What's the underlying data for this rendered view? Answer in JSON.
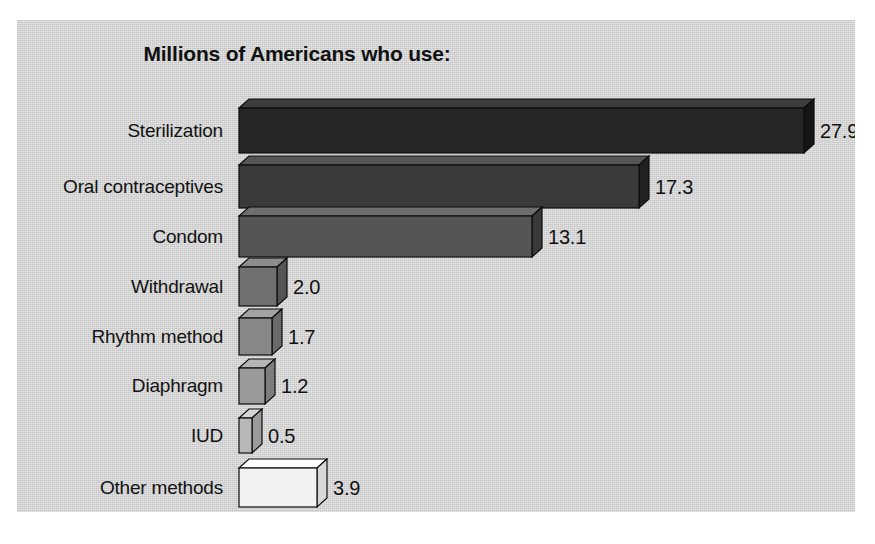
{
  "figure": {
    "panel_bg": "#d2d2d2",
    "outer_bg": "#ffffff",
    "text_color": "#121212"
  },
  "chart_data": {
    "type": "bar",
    "orientation": "horizontal",
    "title": "Millions of Americans who use:",
    "subtitle": "",
    "xlabel": "",
    "ylabel": "",
    "grid": false,
    "legend": false,
    "axis_visible": false,
    "value_label_format": "one-decimal",
    "units": "millions of people",
    "categories": [
      "Sterilization",
      "Oral contraceptives",
      "Condom",
      "Withdrawal",
      "Rhythm method",
      "Diaphragm",
      "IUD",
      "Other methods"
    ],
    "values": [
      27.9,
      17.3,
      13.1,
      2.0,
      1.7,
      1.2,
      0.5,
      3.9
    ],
    "value_labels": [
      "27.9",
      "17.3",
      "13.1",
      "2.0",
      "1.7",
      "1.2",
      "0.5",
      "3.9"
    ],
    "bar_colors": [
      "#262626",
      "#3a3a3a",
      "#555555",
      "#707070",
      "#888888",
      "#9a9a9a",
      "#b8b8b8",
      "#f2f2f2"
    ],
    "xlim": [
      0,
      27.9
    ],
    "ylim": [
      0,
      8
    ]
  },
  "bars": [
    {
      "label": "Sterilization",
      "value": 27.9,
      "value_label": "27.9",
      "color": "#262626",
      "top_color": "#3d3d3d",
      "side_color": "#151515",
      "x": 222,
      "y": 88,
      "w": 565,
      "h": 45
    },
    {
      "label": "Oral contraceptives",
      "value": 17.3,
      "value_label": "17.3",
      "color": "#3a3a3a",
      "top_color": "#555555",
      "side_color": "#222222",
      "x": 222,
      "y": 145,
      "w": 400,
      "h": 43
    },
    {
      "label": "Condom",
      "value": 13.1,
      "value_label": "13.1",
      "color": "#555555",
      "top_color": "#6e6e6e",
      "side_color": "#3a3a3a",
      "x": 222,
      "y": 196,
      "w": 293,
      "h": 41
    },
    {
      "label": "Withdrawal",
      "value": 2.0,
      "value_label": "2.0",
      "color": "#707070",
      "top_color": "#8c8c8c",
      "side_color": "#555555",
      "x": 222,
      "y": 247,
      "w": 38,
      "h": 39
    },
    {
      "label": "Rhythm method",
      "value": 1.7,
      "value_label": "1.7",
      "color": "#888888",
      "top_color": "#a3a3a3",
      "side_color": "#6b6b6b",
      "x": 222,
      "y": 298,
      "w": 33,
      "h": 37
    },
    {
      "label": "Diaphragm",
      "value": 1.2,
      "value_label": "1.2",
      "color": "#9a9a9a",
      "top_color": "#b5b5b5",
      "side_color": "#7d7d7d",
      "x": 222,
      "y": 348,
      "w": 26,
      "h": 36
    },
    {
      "label": "IUD",
      "value": 0.5,
      "value_label": "0.5",
      "color": "#b8b8b8",
      "top_color": "#d4d4d4",
      "side_color": "#9a9a9a",
      "x": 222,
      "y": 398,
      "w": 13,
      "h": 35
    },
    {
      "label": "Other methods",
      "value": 3.9,
      "value_label": "3.9",
      "color": "#f2f2f2",
      "top_color": "#ffffff",
      "side_color": "#d8d8d8",
      "x": 222,
      "y": 448,
      "w": 78,
      "h": 39
    }
  ],
  "geometry": {
    "depth_x": 10,
    "depth_y": 9,
    "label_right_edge": 206,
    "value_gap": 6
  }
}
